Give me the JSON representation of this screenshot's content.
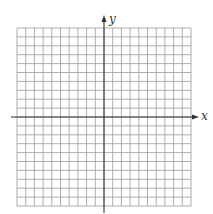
{
  "chart_data": {
    "type": "grid",
    "title": "",
    "xlabel": "x",
    "ylabel": "y",
    "grid": true,
    "columns": 20,
    "rows": 20,
    "xlim": [
      -10,
      10
    ],
    "ylim": [
      -10,
      10
    ],
    "tick_labels": [],
    "series": []
  },
  "axes": {
    "x_label": "x",
    "y_label": "y"
  },
  "colors": {
    "grid_line": "#9a9a9a",
    "axis_line": "#333333",
    "background": "#ffffff"
  },
  "layout": {
    "grid_left": 17,
    "grid_top": 28,
    "grid_right": 191,
    "grid_bottom": 206,
    "origin_x": 104,
    "origin_y": 117
  }
}
